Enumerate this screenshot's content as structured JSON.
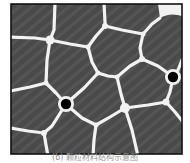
{
  "figure": {
    "type": "grain-structure-diagram",
    "grain_count_visible": 16,
    "particle_count": 2,
    "colors": {
      "grain_fill": "#4a4a4a",
      "grain_stripe": "#5a5a5a",
      "boundary": "#f2f2f2",
      "particle": "#000000",
      "frame": "#111111",
      "background": "#ffffff"
    }
  },
  "caption": "(b) 颗粒材料结构示意图"
}
